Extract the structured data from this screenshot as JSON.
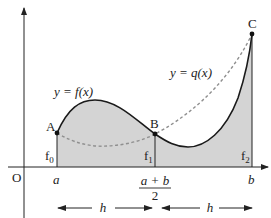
{
  "diagram": {
    "type": "trapezium/Simpson rule area diagram",
    "colors": {
      "fill": "#d4d4d4",
      "curve": "#1a1a1a",
      "dashed": "#8f8f8f",
      "axis": "#222222"
    },
    "origin_label": "O",
    "curve_f_label": "y = f(x)",
    "curve_q_label": "y = q(x)",
    "points": [
      {
        "name": "A",
        "ordinate": "f",
        "sub": "0"
      },
      {
        "name": "B",
        "ordinate": "f",
        "sub": "1"
      },
      {
        "name": "C",
        "ordinate": "f",
        "sub": "2"
      }
    ],
    "x_ticks": {
      "a": "a",
      "mid_num": "a + b",
      "mid_den": "2",
      "b": "b"
    },
    "interval_labels": [
      "h",
      "h"
    ]
  }
}
